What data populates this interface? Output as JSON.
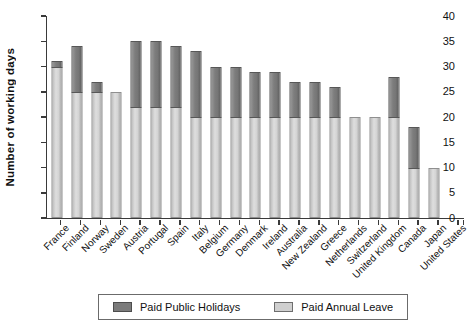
{
  "chart_data": {
    "type": "bar",
    "stacked": true,
    "title": "",
    "xlabel": "",
    "ylabel": "Number of working days",
    "ylim": [
      0,
      40
    ],
    "yticks": [
      0,
      5,
      10,
      15,
      20,
      25,
      30,
      35,
      40
    ],
    "grid": false,
    "legend_position": "bottom",
    "categories": [
      "France",
      "Finland",
      "Norway",
      "Sweden",
      "Austria",
      "Portugal",
      "Spain",
      "Italy",
      "Belgium",
      "Germany",
      "Denmark",
      "Ireland",
      "Australia",
      "New Zealand",
      "Greece",
      "Netherlands",
      "Switzerland",
      "United Kingdom",
      "Canada",
      "Japan",
      "United States"
    ],
    "series": [
      {
        "name": "Paid Annual Leave",
        "color": "#d3d3d3",
        "values": [
          30,
          25,
          25,
          25,
          22,
          22,
          22,
          20,
          20,
          20,
          20,
          20,
          20,
          20,
          20,
          20,
          20,
          20,
          10,
          10,
          0
        ]
      },
      {
        "name": "Paid Public Holidays",
        "color": "#7b7b7b",
        "values": [
          1,
          9,
          2,
          0,
          13,
          13,
          12,
          13,
          10,
          10,
          9,
          9,
          7,
          7,
          6,
          0,
          0,
          8,
          8,
          0,
          0
        ]
      }
    ]
  },
  "legend": {
    "items": [
      {
        "label": "Paid Public Holidays",
        "color": "#7b7b7b"
      },
      {
        "label": "Paid Annual Leave",
        "color": "#d3d3d3"
      }
    ]
  }
}
